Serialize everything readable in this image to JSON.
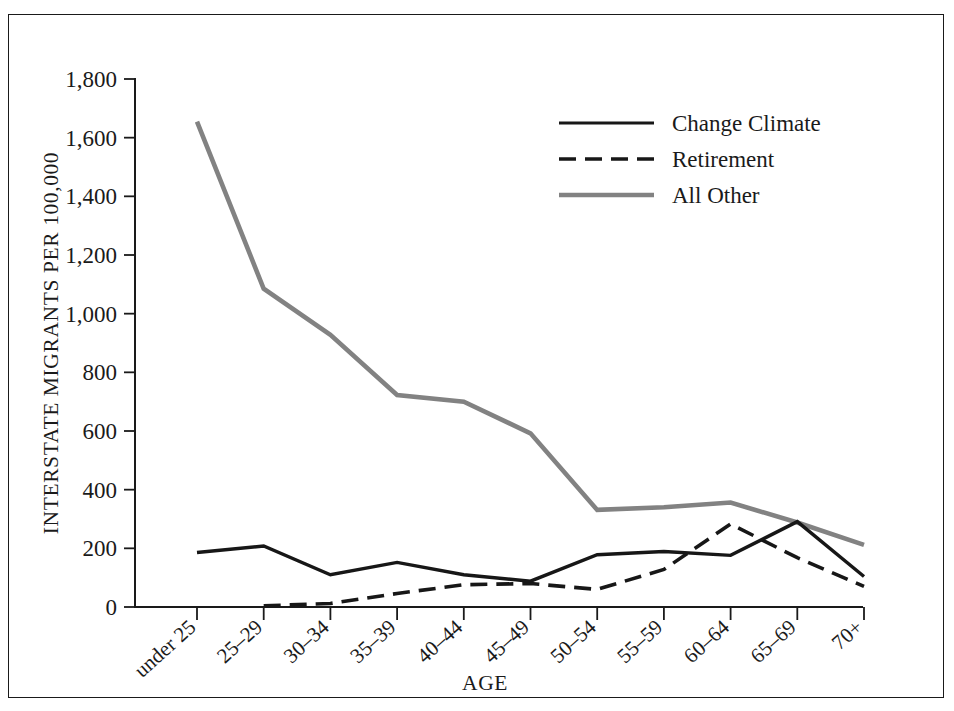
{
  "figure": {
    "caption_faint": "",
    "background": "#ffffff",
    "frame_color": "#1a1a1a"
  },
  "colors": {
    "change_climate": "#171717",
    "retirement": "#171717",
    "all_other": "#828282",
    "axis": "#1a1a1a"
  },
  "legend": {
    "position": "top-right-inside",
    "entries": [
      {
        "label": "Change Climate",
        "style": "solid",
        "color": "#171717"
      },
      {
        "label": "Retirement",
        "style": "dashed",
        "color": "#171717"
      },
      {
        "label": "All Other",
        "style": "solid-gray",
        "color": "#828282"
      }
    ]
  },
  "chart_data": {
    "type": "line",
    "title": "",
    "xlabel": "AGE",
    "ylabel": "INTERSTATE MIGRANTS PER 100,000",
    "categories": [
      "under 25",
      "25–29",
      "30–34",
      "35–39",
      "40–44",
      "45–49",
      "50–54",
      "55–59",
      "60–64",
      "65–69",
      "70+"
    ],
    "ylim": [
      0,
      1800
    ],
    "yticks": [
      0,
      200,
      400,
      600,
      800,
      1000,
      1200,
      1400,
      1600,
      1800
    ],
    "ytick_labels": [
      "0",
      "200",
      "400",
      "600",
      "800",
      "1,000",
      "1,200",
      "1,400",
      "1,600",
      "1,800"
    ],
    "grid": false,
    "series": [
      {
        "name": "Change Climate",
        "values": [
          186,
          208,
          110,
          152,
          110,
          88,
          178,
          189,
          176,
          291,
          104
        ]
      },
      {
        "name": "Retirement",
        "values": [
          null,
          4,
          12,
          46,
          76,
          80,
          60,
          128,
          283,
          168,
          70
        ]
      },
      {
        "name": "All Other",
        "values": [
          1655,
          1085,
          928,
          723,
          700,
          592,
          331,
          340,
          356,
          288,
          212
        ]
      }
    ]
  }
}
